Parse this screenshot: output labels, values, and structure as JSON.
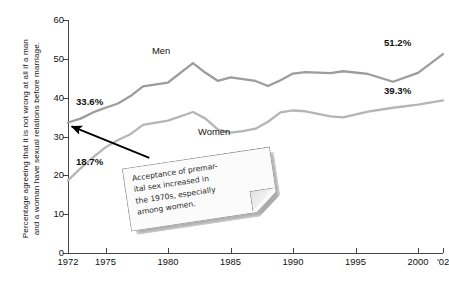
{
  "chart_data": {
    "type": "line",
    "title": "",
    "xlabel": "",
    "ylabel": "Percentage agreeing that it is not wrong at all if a man and a woman have sexual relations before marriage.",
    "ylabel_lines": [
      "Percentage agreeing that it is not wrong at all if a man",
      "and a woman have sexual relations before marriage."
    ],
    "xlim": [
      1972,
      2002
    ],
    "ylim": [
      0,
      60
    ],
    "y_ticks": [
      0,
      10,
      20,
      30,
      40,
      50,
      60
    ],
    "y_tick_labels": [
      "0",
      "10",
      "20",
      "30",
      "40",
      "50",
      "60"
    ],
    "x_ticks": [
      1972,
      1975,
      1980,
      1985,
      1990,
      1995,
      2000,
      2002
    ],
    "x_tick_labels": [
      "1972",
      "1975",
      "1980",
      "1985",
      "1990",
      "1995",
      "2000",
      "'02"
    ],
    "grid": false,
    "legend": "inline-labels",
    "series": [
      {
        "name": "Men",
        "color": "#9c9c9c",
        "label": "Men",
        "start_value_label": "33.6%",
        "end_value_label": "51.2%",
        "x": [
          1972,
          1973,
          1974,
          1975,
          1976,
          1977,
          1978,
          1980,
          1982,
          1983,
          1984,
          1985,
          1986,
          1987,
          1988,
          1989,
          1990,
          1991,
          1993,
          1994,
          1996,
          1998,
          2000,
          2002
        ],
        "values": [
          33.6,
          34.6,
          36.2,
          37.4,
          38.5,
          40.4,
          42.9,
          43.9,
          48.9,
          46.4,
          44.3,
          45.2,
          44.8,
          44.3,
          43.0,
          44.5,
          46.2,
          46.6,
          46.3,
          46.8,
          46.1,
          44.1,
          46.4,
          51.2
        ]
      },
      {
        "name": "Women",
        "color": "#b5b5b5",
        "label": "Women",
        "start_value_label": "18.7%",
        "end_value_label": "39.3%",
        "x": [
          1972,
          1973,
          1974,
          1975,
          1976,
          1977,
          1978,
          1980,
          1982,
          1983,
          1984,
          1985,
          1986,
          1987,
          1988,
          1989,
          1990,
          1991,
          1993,
          1994,
          1996,
          1998,
          2000,
          2002
        ],
        "values": [
          18.7,
          21.8,
          24.6,
          27.2,
          29.1,
          30.6,
          33.0,
          34.1,
          36.3,
          34.6,
          31.8,
          31.0,
          31.4,
          32.0,
          33.8,
          36.2,
          36.7,
          36.5,
          35.2,
          34.9,
          36.4,
          37.4,
          38.2,
          39.3
        ]
      }
    ],
    "annotations": [
      {
        "name": "premarital-sex-callout",
        "text": "Acceptance of premarital sex increased in the 1970s, especially among women.",
        "lines": [
          "Acceptance of premar-",
          "ital sex increased in",
          "the 1970s, especially",
          "among women."
        ],
        "arrow_from": [
          1978.5,
          24.5
        ],
        "arrow_to": [
          1972.3,
          32.6
        ]
      }
    ],
    "colors": {
      "men_line": "#9c9c9c",
      "women_line": "#b5b5b5",
      "axis": "#444444",
      "text": "#111111",
      "callout_bg": "#fbfbfb",
      "callout_border": "#9a9a9a",
      "arrow": "#000000",
      "background": "#ffffff"
    }
  }
}
